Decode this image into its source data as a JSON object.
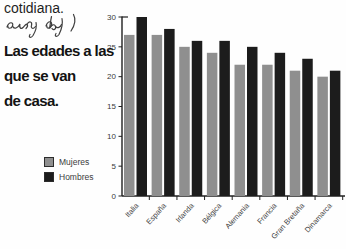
{
  "page": {
    "top_text": "cotidiana.",
    "handwritten_note": "every day",
    "title_lines": [
      "Las edades a las",
      "que se van",
      "de casa."
    ]
  },
  "legend": {
    "items": [
      {
        "label": "Mujeres",
        "color": "#8f8f8f"
      },
      {
        "label": "Hombres",
        "color": "#1c1c1c"
      }
    ]
  },
  "chart_data": {
    "type": "bar",
    "title": "Las edades a las que se van de casa",
    "categories": [
      "Italia",
      "España",
      "Irlanda",
      "Bélgica",
      "Alemania",
      "Francia",
      "Gran Bretaña",
      "Dinamarca"
    ],
    "series": [
      {
        "name": "Mujeres",
        "color": "#8f8f8f",
        "values": [
          27,
          27,
          25,
          24,
          22,
          22,
          21,
          20
        ]
      },
      {
        "name": "Hombres",
        "color": "#1c1c1c",
        "values": [
          30,
          28,
          26,
          26,
          25,
          24,
          23,
          21
        ]
      }
    ],
    "xlabel": "",
    "ylabel": "",
    "ylim": [
      0,
      30
    ],
    "yticks": [
      0,
      5,
      10,
      15,
      20,
      25,
      30
    ],
    "grid": false,
    "legend_position": "bottom-left",
    "x_label_rotation": -48
  },
  "colors": {
    "background": "#fefefe",
    "axis": "#1f1f1f",
    "tick_label": "#3a3a3a",
    "handwriting": "#3f3f3f"
  }
}
